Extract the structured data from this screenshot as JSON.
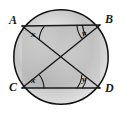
{
  "figure": {
    "type": "circle-geometry-diagram",
    "background_color": "#ffffff",
    "stroke_color": "#1a1a1a",
    "shading": {
      "type": "radial-gradient",
      "inner_color": "#f2f2f2",
      "mid_color": "#c9c9c9",
      "outer_color": "#ededed"
    },
    "circle": {
      "label": "circle",
      "center_x": 61,
      "center_y": 57,
      "radius": 48
    },
    "points": [
      {
        "id": "A",
        "label": "A",
        "x": 22,
        "y": 26,
        "label_x": 9,
        "label_y": 24
      },
      {
        "id": "B",
        "label": "B",
        "x": 100,
        "y": 25,
        "label_x": 106,
        "label_y": 23
      },
      {
        "id": "C",
        "label": "C",
        "x": 22,
        "y": 88,
        "label_x": 9,
        "label_y": 91
      },
      {
        "id": "D",
        "label": "D",
        "x": 100,
        "y": 88,
        "label_x": 106,
        "label_y": 92
      }
    ],
    "segments": [
      {
        "name": "chord-AB",
        "from": "A",
        "to": "B"
      },
      {
        "name": "chord-CD",
        "from": "C",
        "to": "D"
      },
      {
        "name": "diagonal-AD",
        "from": "A",
        "to": "D"
      },
      {
        "name": "diagonal-CB",
        "from": "C",
        "to": "B"
      }
    ],
    "intersection": {
      "name": "diagonal-intersection",
      "x": 61,
      "y": 57
    },
    "angles": [
      {
        "id": "angle-x-at-A",
        "label": "x",
        "vertex": "A",
        "label_x": 33,
        "label_y": 36,
        "arcs": 1
      },
      {
        "id": "angle-y-at-B",
        "label": "y",
        "vertex": "B",
        "label_x": 84,
        "label_y": 35,
        "arcs": 2
      },
      {
        "id": "angle-x-at-C",
        "label": "x",
        "vertex": "C",
        "label_x": 33,
        "label_y": 82,
        "arcs": 1
      },
      {
        "id": "angle-y-at-D",
        "label": "y",
        "vertex": "D",
        "label_x": 84,
        "label_y": 81,
        "arcs": 2
      }
    ]
  }
}
